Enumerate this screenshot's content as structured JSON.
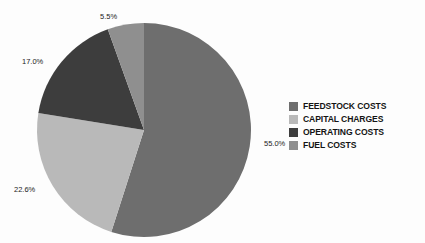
{
  "chart_data": {
    "type": "pie",
    "title": "",
    "categories": [
      "FEEDSTOCK COSTS",
      "CAPITAL CHARGES",
      "OPERATING COSTS",
      "FUEL COSTS"
    ],
    "values": [
      55.0,
      22.6,
      17.0,
      5.5
    ],
    "value_labels": [
      "55.0%",
      "22.6%",
      "17.0%",
      "5.5%"
    ],
    "colors": [
      "#6e6e6e",
      "#b9b9b9",
      "#3d3d3d",
      "#8f8f8f"
    ],
    "start_angle_deg": 0,
    "direction": "clockwise",
    "legend_position": "right",
    "grid": false,
    "units": "percent",
    "total": 100.1
  },
  "legend": {
    "items": [
      {
        "label": "FEEDSTOCK COSTS",
        "color": "#6e6e6e"
      },
      {
        "label": "CAPITAL CHARGES",
        "color": "#b9b9b9"
      },
      {
        "label": "OPERATING COSTS",
        "color": "#3d3d3d"
      },
      {
        "label": "FUEL COSTS",
        "color": "#8f8f8f"
      }
    ]
  },
  "labels": {
    "feedstock": "55.0%",
    "capital": "22.6%",
    "operating": "17.0%",
    "fuel": "5.5%"
  },
  "canvas": {
    "background": "#fdfdfd",
    "center_x": 144,
    "center_y": 130,
    "radius": 107
  }
}
